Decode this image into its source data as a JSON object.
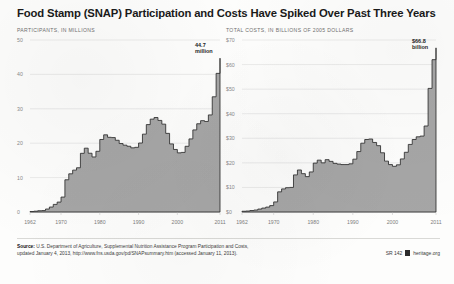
{
  "title": "Food Stamp (SNAP) Participation and Costs Have Spiked Over Past Three Years",
  "footer": {
    "source_label": "Source:",
    "line1": " U.S. Department of Agriculture, Supplemental Nutrition Assistance Program Participation and Costs,",
    "line2": "updated January 4, 2013, http://www.fns.usda.gov/pd/SNAPsummary.htm (accessed January 11, 2013)."
  },
  "credit": {
    "report_id": "SR 142",
    "site": "heritage.org",
    "mark": "heritage-logo-icon"
  },
  "colors": {
    "area_fill": "#a6a6a6",
    "area_stroke": "#2d2d2d",
    "grid": "#cfcfcf",
    "axis_text": "#8a8a8a",
    "title": "#1a1a1a"
  },
  "chart_data": [
    {
      "type": "area",
      "id": "participants",
      "title": "PARTICIPANTS, IN MILLIONS",
      "xlabel": "",
      "ylabel": "Participants, in millions",
      "grid": true,
      "legend": "none",
      "step": true,
      "xlim": [
        1962,
        2011
      ],
      "ylim": [
        0,
        50
      ],
      "yticks": [
        0,
        10,
        20,
        30,
        40,
        50
      ],
      "ytick_labels": [
        "0",
        "10",
        "20",
        "30",
        "40",
        "50"
      ],
      "xticks": [
        1962,
        1970,
        1980,
        1990,
        2000,
        2011
      ],
      "xtick_labels": [
        "1962",
        "1970",
        "1980",
        "1990",
        "2000",
        "2011"
      ],
      "annotation": {
        "text": "44.7\nmillion",
        "line1": "44.7",
        "line2": "million",
        "x": 2011,
        "y": 44.7
      },
      "x": [
        1962,
        1963,
        1964,
        1965,
        1966,
        1967,
        1968,
        1969,
        1970,
        1971,
        1972,
        1973,
        1974,
        1975,
        1976,
        1977,
        1978,
        1979,
        1980,
        1981,
        1982,
        1983,
        1984,
        1985,
        1986,
        1987,
        1988,
        1989,
        1990,
        1991,
        1992,
        1993,
        1994,
        1995,
        1996,
        1997,
        1998,
        1999,
        2000,
        2001,
        2002,
        2003,
        2004,
        2005,
        2006,
        2007,
        2008,
        2009,
        2010,
        2011
      ],
      "values": [
        0.14,
        0.24,
        0.37,
        0.42,
        0.86,
        1.44,
        2.21,
        2.88,
        4.34,
        9.37,
        11.1,
        12.17,
        12.86,
        17.06,
        18.55,
        17.08,
        16.0,
        17.65,
        21.08,
        22.43,
        21.72,
        21.63,
        20.85,
        19.9,
        19.43,
        19.11,
        18.65,
        18.8,
        20.05,
        22.63,
        25.41,
        26.99,
        27.47,
        26.62,
        25.54,
        22.86,
        19.79,
        18.18,
        17.19,
        17.32,
        19.1,
        21.25,
        23.86,
        25.65,
        26.55,
        26.32,
        28.22,
        33.49,
        40.3,
        44.7
      ]
    },
    {
      "type": "area",
      "id": "costs",
      "title": "TOTAL COSTS, IN BILLIONS OF 2005 DOLLARS",
      "xlabel": "",
      "ylabel": "Total costs, in billions of 2005 dollars",
      "grid": true,
      "legend": "none",
      "step": true,
      "xlim": [
        1962,
        2011
      ],
      "ylim": [
        0,
        70
      ],
      "yticks": [
        0,
        10,
        20,
        30,
        40,
        50,
        60,
        70
      ],
      "ytick_labels": [
        "$0",
        "$10",
        "$20",
        "$30",
        "$40",
        "$50",
        "$60",
        "$70"
      ],
      "xticks": [
        1962,
        1970,
        1980,
        1990,
        2000,
        2011
      ],
      "xtick_labels": [
        "1962",
        "1970",
        "1980",
        "1990",
        "2000",
        "2011"
      ],
      "annotation": {
        "text": "$66.8\nbillion",
        "line1": "$66.8",
        "line2": "billion",
        "x": 2011,
        "y": 66.8
      },
      "x": [
        1962,
        1963,
        1964,
        1965,
        1966,
        1967,
        1968,
        1969,
        1970,
        1971,
        1972,
        1973,
        1974,
        1975,
        1976,
        1977,
        1978,
        1979,
        1980,
        1981,
        1982,
        1983,
        1984,
        1985,
        1986,
        1987,
        1988,
        1989,
        1990,
        1991,
        1992,
        1993,
        1994,
        1995,
        1996,
        1997,
        1998,
        1999,
        2000,
        2001,
        2002,
        2003,
        2004,
        2005,
        2006,
        2007,
        2008,
        2009,
        2010,
        2011
      ],
      "values": [
        0.3,
        0.4,
        0.6,
        0.8,
        1.2,
        1.6,
        2.0,
        2.6,
        4.1,
        8.2,
        9.4,
        9.9,
        10.0,
        15.1,
        17.1,
        15.6,
        14.4,
        16.3,
        19.9,
        21.1,
        20.0,
        21.3,
        20.6,
        19.8,
        19.5,
        19.3,
        19.3,
        19.6,
        21.5,
        24.6,
        28.0,
        29.5,
        29.7,
        28.3,
        27.0,
        24.1,
        20.7,
        19.3,
        18.6,
        19.2,
        21.6,
        24.3,
        27.5,
        29.5,
        30.6,
        30.9,
        35.0,
        50.3,
        62.0,
        66.8
      ]
    }
  ]
}
